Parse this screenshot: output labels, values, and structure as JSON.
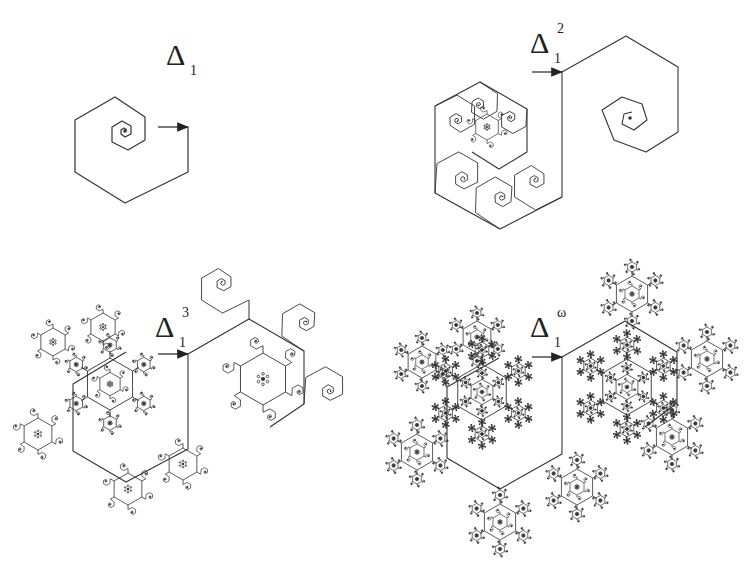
{
  "figure": {
    "background": "#ffffff",
    "stroke_color": "#333333",
    "panels": [
      {
        "id": "panel-1",
        "label": {
          "symbol": "Δ",
          "subscript": "1",
          "superscript": "",
          "x": 166,
          "y": 40
        },
        "arrow": {
          "from": [
            158,
            127
          ],
          "to": [
            188,
            127
          ]
        },
        "origin": [
          188,
          127
        ],
        "scale": 1.0,
        "depth": 0
      },
      {
        "id": "panel-2",
        "label": {
          "symbol": "Δ",
          "subscript": "1",
          "superscript": "2",
          "x": 530,
          "y": 28
        },
        "arrow": {
          "from": [
            532,
            72
          ],
          "to": [
            562,
            72
          ]
        },
        "origin": [
          562,
          72
        ],
        "scale": 1.0,
        "depth": 1
      },
      {
        "id": "panel-3",
        "label": {
          "symbol": "Δ",
          "subscript": "1",
          "superscript": "3",
          "x": 152,
          "y": 312
        },
        "arrow": {
          "from": [
            158,
            354
          ],
          "to": [
            188,
            354
          ]
        },
        "origin": [
          188,
          354
        ],
        "scale": 1.0,
        "depth": 2
      },
      {
        "id": "panel-4",
        "label": {
          "symbol": "Δ",
          "subscript": "1",
          "superscript": "ω",
          "x": 532,
          "y": 312
        },
        "arrow": {
          "from": [
            532,
            357
          ],
          "to": [
            562,
            357
          ]
        },
        "origin": [
          562,
          357
        ],
        "scale": 1.0,
        "depth": 4
      }
    ]
  }
}
